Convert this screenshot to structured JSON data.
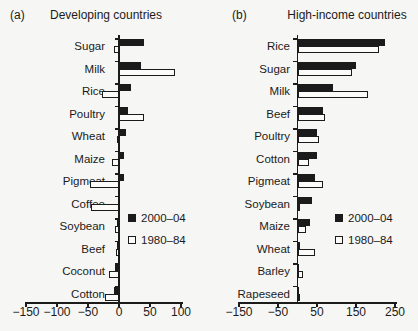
{
  "chart_data": [
    {
      "type": "bar",
      "orientation": "horizontal",
      "panel": "(a)",
      "title": "Developing countries",
      "categories": [
        "Sugar",
        "Milk",
        "Rice",
        "Poultry",
        "Wheat",
        "Maize",
        "Pigmeat",
        "Coffee",
        "Soybean",
        "Beef",
        "Coconut",
        "Cotton"
      ],
      "series": [
        {
          "name": "2000–04",
          "color": "#1b1b1b",
          "values": [
            40,
            35,
            20,
            15,
            11,
            8,
            8,
            -2,
            -4,
            -3,
            -7,
            -8
          ]
        },
        {
          "name": "1980–84",
          "color": "#fbfbfa",
          "values": [
            -8,
            90,
            -27,
            40,
            -4,
            -12,
            -46,
            -45,
            -6,
            -5,
            -16,
            -22
          ]
        }
      ],
      "xlim": [
        -150,
        100
      ],
      "xticks": [
        -150,
        -100,
        -50,
        0,
        50,
        100
      ],
      "xtick_labels": [
        "−150",
        "−100",
        "−50",
        "0",
        "50",
        "100"
      ],
      "grid": false,
      "legend_position": "inside-lower-right"
    },
    {
      "type": "bar",
      "orientation": "horizontal",
      "panel": "(b)",
      "title": "High-income countries",
      "categories": [
        "Rice",
        "Sugar",
        "Milk",
        "Beef",
        "Poultry",
        "Cotton",
        "Pigmeat",
        "Soybean",
        "Maize",
        "Wheat",
        "Barley",
        "Rapeseed"
      ],
      "series": [
        {
          "name": "2000–04",
          "color": "#1b1b1b",
          "values": [
            225,
            150,
            90,
            65,
            50,
            50,
            45,
            38,
            32,
            6,
            3,
            2
          ]
        },
        {
          "name": "1980–84",
          "color": "#fbfbfa",
          "values": [
            210,
            140,
            180,
            70,
            55,
            30,
            65,
            5,
            22,
            45,
            14,
            1
          ]
        }
      ],
      "xlim": [
        -150,
        250
      ],
      "xticks": [
        -150,
        -50,
        50,
        150,
        250
      ],
      "xtick_labels": [
        "−150",
        "−50",
        "50",
        "150",
        "250"
      ],
      "grid": false,
      "legend_position": "inside-lower-right"
    }
  ]
}
